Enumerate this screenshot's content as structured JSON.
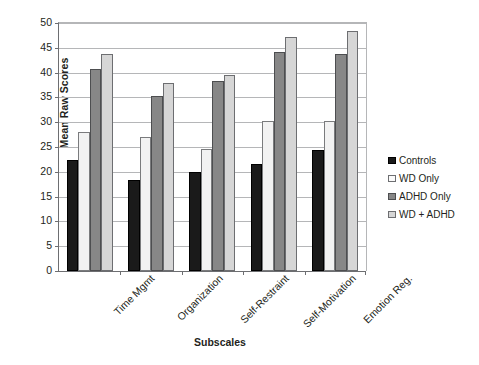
{
  "chart_data": {
    "type": "bar",
    "title": "",
    "xlabel": "Subscales",
    "ylabel": "Mean Raw Scores",
    "categories": [
      "Time Mgmt",
      "Organization",
      "Self-Restraint",
      "Self-Motivation",
      "Emotion Reg."
    ],
    "series": [
      {
        "name": "Controls",
        "color": "#1a1a1a",
        "values": [
          22.3,
          18.4,
          19.9,
          21.5,
          24.3
        ]
      },
      {
        "name": "WD Only",
        "color": "#f2f2f2",
        "values": [
          28.0,
          27.1,
          24.5,
          30.2,
          30.3
        ]
      },
      {
        "name": "ADHD Only",
        "color": "#878787",
        "values": [
          40.8,
          35.3,
          38.3,
          44.2,
          43.8
        ]
      },
      {
        "name": "WD + ADHD",
        "color": "#d6d6d6",
        "values": [
          43.7,
          38.0,
          39.6,
          47.1,
          48.3
        ]
      }
    ],
    "ylim": [
      0,
      50
    ],
    "ytick_step": 5,
    "yticks": [
      50,
      45,
      40,
      35,
      30,
      25,
      20,
      15,
      10,
      5,
      0
    ],
    "grid": "horizontal",
    "legend_position": "right",
    "xtick_rotation": -45
  }
}
